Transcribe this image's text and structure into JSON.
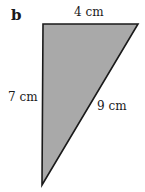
{
  "figure": {
    "part_label": "b",
    "shape": "right-triangle",
    "fill_color": "#a9a9a9",
    "stroke_color": "#1a1a1a",
    "vertices": {
      "top_left": [
        43,
        24
      ],
      "top_right": [
        138,
        24
      ],
      "bottom": [
        42,
        185
      ]
    },
    "sides": [
      {
        "name": "top",
        "label": "4 cm"
      },
      {
        "name": "left",
        "label": "7 cm"
      },
      {
        "name": "hypotenuse",
        "label": "9 cm"
      }
    ]
  }
}
